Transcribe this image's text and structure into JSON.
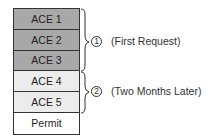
{
  "rows": [
    {
      "label": "ACE 1",
      "shade": "dark"
    },
    {
      "label": "ACE 2",
      "shade": "dark"
    },
    {
      "label": "ACE 3",
      "shade": "dark"
    },
    {
      "label": "ACE 4",
      "shade": "light"
    },
    {
      "label": "ACE 5",
      "shade": "light"
    },
    {
      "label": "Permit",
      "shade": "white"
    }
  ],
  "groups": [
    {
      "number": "1",
      "text": "(First Request)"
    },
    {
      "number": "2",
      "text": "(Two Months Later)"
    }
  ],
  "colors": {
    "dark": "#a8a8a8",
    "light": "#ececec",
    "white": "#ffffff",
    "line": "#333333"
  }
}
